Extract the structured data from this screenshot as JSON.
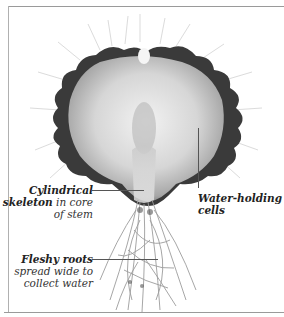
{
  "figure": {
    "labels": [
      {
        "id": "skeleton",
        "bold": "Cylindrical skeleton",
        "text_lines": [
          "Cylindrical",
          "skeleton in core",
          "of stem"
        ],
        "bold_part": [
          "Cylindrical",
          "skeleton"
        ],
        "plain_part": [
          " in core",
          "of stem"
        ]
      },
      {
        "id": "water",
        "text_lines": [
          "Water-holding",
          "cells"
        ]
      },
      {
        "id": "roots",
        "text_lines": [
          "Fleshy roots",
          "spread wide to",
          "collect water"
        ]
      }
    ]
  },
  "labels": {
    "skeleton": {
      "line1_bold": "Cylindrical",
      "line2_bold": "skeleton",
      "line2_plain": " in core",
      "line3": "of stem"
    },
    "water": {
      "line1": "Water-holding",
      "line2": "cells"
    },
    "roots": {
      "line1_bold": "Fleshy roots",
      "line2": "spread wide to",
      "line3": "collect water"
    }
  },
  "colors": {
    "background": "#ffffff",
    "frame": "#9a9a9a",
    "text": "#333333",
    "cactus_dark": "#2a2a2a",
    "cactus_light": "#d8d8d8"
  }
}
